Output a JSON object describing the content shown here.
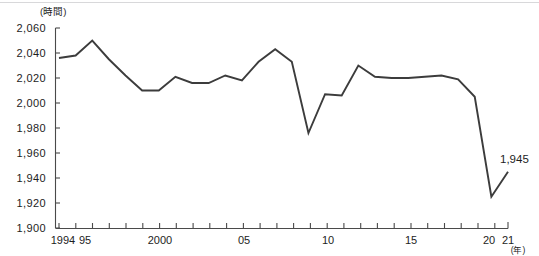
{
  "chart_data": {
    "type": "line",
    "title": "",
    "xlabel": "(年)",
    "ylabel": "(時間)",
    "y_unit": "(時間)",
    "x_unit": "(年)",
    "grid": false,
    "legend": "none",
    "ylim": [
      1900,
      2060
    ],
    "xlim": [
      1994,
      2021
    ],
    "ytick_labels": [
      "2,060",
      "2,040",
      "2,020",
      "2,000",
      "1,980",
      "1,960",
      "1,940",
      "1,920",
      "1,900"
    ],
    "ytick_values": [
      2060,
      2040,
      2020,
      2000,
      1980,
      1960,
      1940,
      1920,
      1900
    ],
    "xtick_labels": [
      "1994",
      "95",
      "2000",
      "05",
      "10",
      "15",
      "20",
      "21"
    ],
    "xtick_values": [
      1994,
      1995,
      2000,
      2005,
      2010,
      2015,
      2020,
      2021
    ],
    "x": [
      1994,
      1995,
      1996,
      1997,
      1998,
      1999,
      2000,
      2001,
      2002,
      2003,
      2004,
      2005,
      2006,
      2007,
      2008,
      2009,
      2010,
      2011,
      2012,
      2013,
      2014,
      2015,
      2016,
      2017,
      2018,
      2019,
      2020,
      2021
    ],
    "series": [
      {
        "name": "年間総実労働時間",
        "values": [
          2036,
          2038,
          2050,
          2035,
          2022,
          2010,
          2010,
          2021,
          2016,
          2016,
          2022,
          2018,
          2033,
          2043,
          2033,
          1976,
          2007,
          2006,
          2030,
          2021,
          2020,
          2020,
          2021,
          2022,
          2019,
          2005,
          1925,
          1945
        ]
      }
    ],
    "annotations": [
      {
        "text": "1,945",
        "x": 2021,
        "y": 1945
      }
    ],
    "line_color": "#3c3c3c",
    "axis_color": "#4a4a4a",
    "background_color": "#ffffff"
  }
}
